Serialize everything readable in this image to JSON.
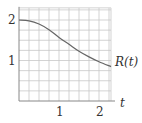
{
  "chart_data": {
    "type": "line",
    "title": "",
    "xlabel": "t",
    "ylabel": "",
    "xlim": [
      0,
      2.3
    ],
    "ylim": [
      0,
      2.3
    ],
    "grid": true,
    "grid_step": 0.25,
    "x_ticks": [
      1,
      2
    ],
    "x_tick_labels": [
      "1",
      "2"
    ],
    "y_ticks": [
      1,
      2
    ],
    "y_tick_labels": [
      "1",
      "2"
    ],
    "series": [
      {
        "name": "R(t)",
        "label": "R(t)",
        "x": [
          0,
          0.25,
          0.5,
          0.75,
          1.0,
          1.25,
          1.5,
          1.75,
          2.0,
          2.3
        ],
        "values": [
          2.0,
          1.98,
          1.9,
          1.76,
          1.57,
          1.4,
          1.23,
          1.09,
          0.97,
          0.85
        ]
      }
    ]
  },
  "labels": {
    "x_axis": "t",
    "curve": "R(t)",
    "x_tick_1": "1",
    "x_tick_2": "2",
    "y_tick_1": "1",
    "y_tick_2": "2"
  },
  "colors": {
    "grid": "#c8c8c8",
    "axis": "#888888",
    "curve": "#666666",
    "text": "#333333"
  }
}
